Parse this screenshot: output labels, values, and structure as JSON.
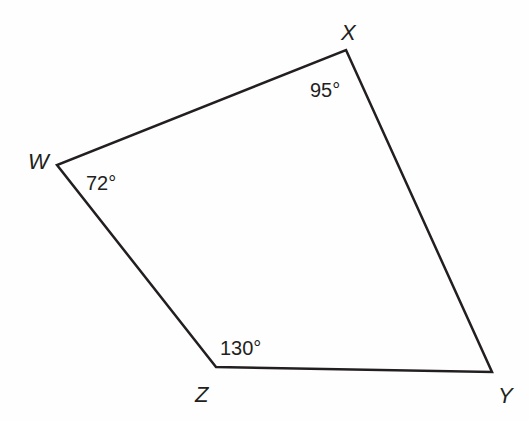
{
  "figure": {
    "type": "quadrilateral",
    "stroke_color": "#231f20",
    "vertices": [
      {
        "name": "X",
        "x": 346,
        "y": 50,
        "label_x": 343,
        "label_y": 40,
        "angle": "95°",
        "angle_x": 310,
        "angle_y": 96
      },
      {
        "name": "Y",
        "x": 492,
        "y": 372,
        "label_x": 498,
        "label_y": 402,
        "angle": "",
        "angle_x": 0,
        "angle_y": 0
      },
      {
        "name": "Z",
        "x": 216,
        "y": 367,
        "label_x": 195,
        "label_y": 400,
        "angle": "130°",
        "angle_x": 220,
        "angle_y": 355
      },
      {
        "name": "W",
        "x": 57,
        "y": 165,
        "label_x": 29,
        "label_y": 168,
        "angle": "72°",
        "angle_x": 86,
        "angle_y": 190
      }
    ],
    "labels": {
      "X": "X",
      "Y": "Y",
      "Z": "Z",
      "W": "W",
      "angle_X": "95°",
      "angle_W": "72°",
      "angle_Z": "130°"
    }
  }
}
